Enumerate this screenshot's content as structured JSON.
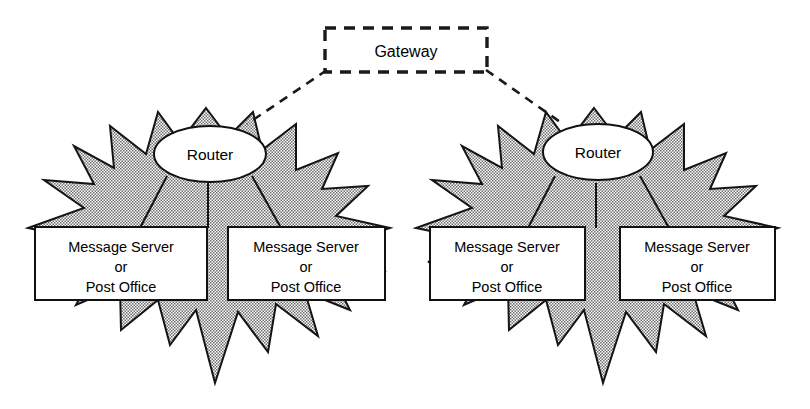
{
  "diagram": {
    "title_text": "Gateway",
    "background_color": "#ffffff",
    "line_color": "#1a1a1a",
    "star_fill_color": "#b4b4b4",
    "box_fill_color": "#ffffff",
    "gateway": {
      "label": "Gateway",
      "style": "dashed-rectangle"
    },
    "links": [
      {
        "name": "gateway-to-left-router",
        "style": "dashed"
      },
      {
        "name": "gateway-to-right-router",
        "style": "dashed"
      }
    ],
    "clusters": [
      {
        "name": "left-network-cloud",
        "shape": "starburst",
        "router": {
          "label": "Router",
          "shape": "ellipse"
        },
        "nodes": [
          {
            "line1": "Message Server",
            "line2": "or",
            "line3": "Post Office"
          },
          {
            "line1": "Message Server",
            "line2": "or",
            "line3": "Post Office"
          }
        ]
      },
      {
        "name": "right-network-cloud",
        "shape": "starburst",
        "router": {
          "label": "Router",
          "shape": "ellipse"
        },
        "nodes": [
          {
            "line1": "Message Server",
            "line2": "or",
            "line3": "Post Office"
          },
          {
            "line1": "Message Server",
            "line2": "or",
            "line3": "Post Office"
          }
        ]
      }
    ]
  }
}
